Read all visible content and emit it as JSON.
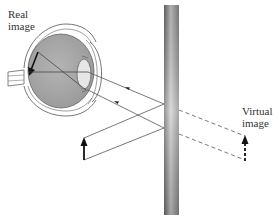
{
  "diagram": {
    "labels": {
      "real_image_line1": "Real",
      "real_image_line2": "image",
      "virtual_image_line1": "Virtual",
      "virtual_image_line2": "image"
    },
    "colors": {
      "line": "#555555",
      "eye_fill": "#a8a8a8",
      "mirror_dark": "#7a7a7a",
      "mirror_light": "#d8d8d8",
      "arrow": "#111111"
    },
    "components": [
      "eye",
      "plane-mirror",
      "object-arrow",
      "virtual-image-arrow",
      "real-image-arrow",
      "light-rays"
    ]
  }
}
